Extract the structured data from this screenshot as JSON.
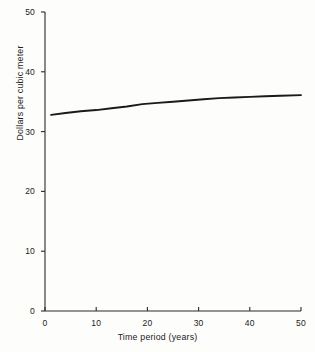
{
  "chart_data": {
    "type": "line",
    "title": "",
    "xlabel": "Time period (years)",
    "ylabel": "Dollars per cubic meter",
    "xlim": [
      0,
      50
    ],
    "ylim": [
      0,
      50
    ],
    "xticks": [
      0,
      10,
      20,
      30,
      40,
      50
    ],
    "yticks": [
      0,
      10,
      20,
      30,
      40,
      50
    ],
    "xtick_labels": [
      "0",
      "10",
      "20",
      "30",
      "40",
      "50"
    ],
    "ytick_labels": [
      "0",
      "10",
      "20",
      "30",
      "40",
      "50"
    ],
    "grid": false,
    "legend": null,
    "series": [
      {
        "name": "Dollars per cubic meter",
        "color": "#1a1a1a",
        "x": [
          1.2,
          4,
          7,
          10,
          13,
          16,
          19,
          22,
          25,
          28,
          31,
          34,
          37,
          40,
          43,
          46,
          50
        ],
        "values": [
          32.8,
          33.1,
          33.4,
          33.6,
          33.9,
          34.2,
          34.6,
          34.8,
          35.0,
          35.2,
          35.4,
          35.6,
          35.7,
          35.8,
          35.9,
          36.0,
          36.1
        ]
      }
    ]
  },
  "axes": {
    "x_label_text": "Time period (years)",
    "y_label_text": "Dollars per cubic meter"
  }
}
